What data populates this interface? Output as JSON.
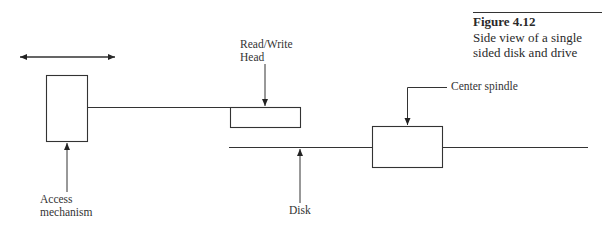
{
  "figure": {
    "number": "Figure 4.12",
    "caption_line1": "Side view of a single",
    "caption_line2": "sided disk and drive"
  },
  "labels": {
    "read_write_head_line1": "Read/Write",
    "read_write_head_line2": "Head",
    "center_spindle": "Center spindle",
    "access_mechanism_line1": "Access",
    "access_mechanism_line2": "mechanism",
    "disk": "Disk"
  },
  "colors": {
    "line": "#333333",
    "background": "#ffffff"
  }
}
